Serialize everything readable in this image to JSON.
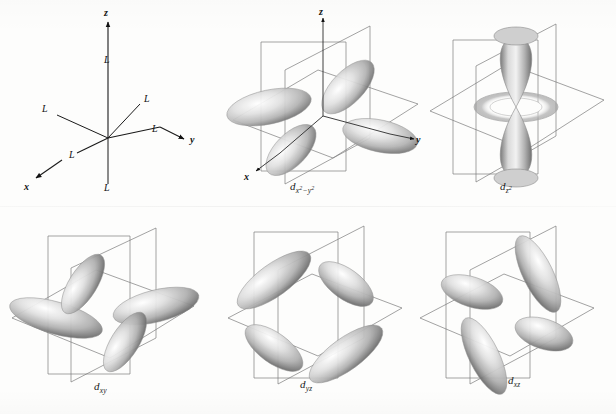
{
  "figure": {
    "background_color": "#fdfdfc",
    "line_color": "#7b7b7b",
    "axis_color": "#1a1a1a",
    "lobe_color": "#8a8a8a"
  },
  "panels": [
    {
      "id": "ligand-field",
      "caption": "",
      "type": "octahedral-ligand-field",
      "axes": [
        "z",
        "y",
        "x"
      ],
      "axis_labels": {
        "z": "z",
        "y": "y",
        "x": "x"
      },
      "ligand_label": "L",
      "ligand_count": 6,
      "ligand_labels": [
        "L",
        "L",
        "L",
        "L",
        "L",
        "L"
      ]
    },
    {
      "id": "dx2-y2",
      "caption_main": "d",
      "caption_sub": "x",
      "caption_sub_sup1": "2",
      "caption_sub_mid": "−y",
      "caption_sub_sup2": "2",
      "caption_plain": "dx2−y2",
      "type": "orbital",
      "lobes": 4,
      "lobe_orientation": "along x and y axes",
      "axes": [
        "z",
        "y",
        "x"
      ],
      "axis_labels": {
        "z": "z",
        "y": "y",
        "x": "x"
      },
      "has_torus": false
    },
    {
      "id": "dz2",
      "caption_main": "d",
      "caption_sub": "z",
      "caption_sub_sup1": "2",
      "caption_plain": "dz2",
      "type": "orbital",
      "lobes": 2,
      "lobe_orientation": "along z axis",
      "axes": [],
      "axis_labels": {},
      "has_torus": true
    },
    {
      "id": "dxy",
      "caption_main": "d",
      "caption_sub": "xy",
      "caption_plain": "dxy",
      "type": "orbital",
      "lobes": 4,
      "lobe_orientation": "between x and y axes in xy plane",
      "axes": [],
      "axis_labels": {},
      "has_torus": false
    },
    {
      "id": "dyz",
      "caption_main": "d",
      "caption_sub": "yz",
      "caption_plain": "dyz",
      "type": "orbital",
      "lobes": 4,
      "lobe_orientation": "between y and z axes in yz plane",
      "axes": [],
      "axis_labels": {},
      "has_torus": false
    },
    {
      "id": "dxz",
      "caption_main": "d",
      "caption_sub": "xz",
      "caption_plain": "dxz",
      "type": "orbital",
      "lobes": 4,
      "lobe_orientation": "between x and z axes in xz plane",
      "axes": [],
      "axis_labels": {},
      "has_torus": false
    }
  ]
}
